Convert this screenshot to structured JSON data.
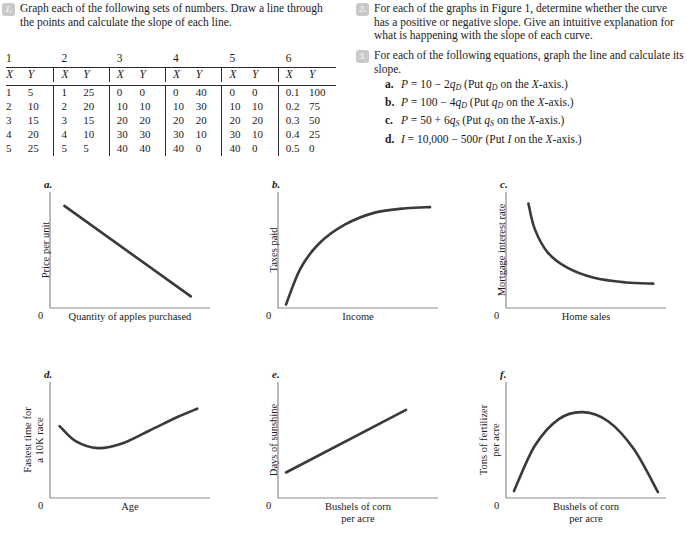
{
  "questions": [
    {
      "number": "1.",
      "text": "Graph each of the following sets of numbers. Draw a line through the points and calculate the slope of each line."
    },
    {
      "number": "2.",
      "text": "For each of the graphs in Figure 1, determine whether the curve has a positive or negative slope. Give an intuitive explanation for what is happening with the slope of each curve."
    },
    {
      "number": "3.",
      "text": "For each of the following equations, graph the line and calculate its slope."
    }
  ],
  "equations": [
    {
      "label": "a.",
      "text": "P = 10 − 2qD (Put qD on the X-axis.)"
    },
    {
      "label": "b.",
      "text": "P = 100 − 4qD (Put qD on the X-axis.)"
    },
    {
      "label": "c.",
      "text": "P = 50 + 6qS (Put qS on the X-axis.)"
    },
    {
      "label": "d.",
      "text": "I = 10,000 − 500r (Put I on the X-axis.)"
    }
  ],
  "table": {
    "group_headers": [
      "1",
      "2",
      "3",
      "4",
      "5",
      "6"
    ],
    "column_headers": [
      "X",
      "Y"
    ],
    "groups": [
      {
        "name": "1",
        "rows": [
          [
            "1",
            "5"
          ],
          [
            "2",
            "10"
          ],
          [
            "3",
            "15"
          ],
          [
            "4",
            "20"
          ],
          [
            "5",
            "25"
          ]
        ]
      },
      {
        "name": "2",
        "rows": [
          [
            "1",
            "25"
          ],
          [
            "2",
            "20"
          ],
          [
            "3",
            "15"
          ],
          [
            "4",
            "10"
          ],
          [
            "5",
            "5"
          ]
        ]
      },
      {
        "name": "3",
        "rows": [
          [
            "0",
            "0"
          ],
          [
            "10",
            "10"
          ],
          [
            "20",
            "20"
          ],
          [
            "30",
            "30"
          ],
          [
            "40",
            "40"
          ]
        ]
      },
      {
        "name": "4",
        "rows": [
          [
            "0",
            "40"
          ],
          [
            "10",
            "30"
          ],
          [
            "20",
            "20"
          ],
          [
            "30",
            "10"
          ],
          [
            "40",
            "0"
          ]
        ]
      },
      {
        "name": "5",
        "rows": [
          [
            "0",
            "0"
          ],
          [
            "10",
            "10"
          ],
          [
            "20",
            "20"
          ],
          [
            "30",
            "10"
          ],
          [
            "40",
            "0"
          ]
        ]
      },
      {
        "name": "6",
        "rows": [
          [
            "0.1",
            "100"
          ],
          [
            "0.2",
            "75"
          ],
          [
            "0.3",
            "50"
          ],
          [
            "0.4",
            "25"
          ],
          [
            "0.5",
            "0"
          ]
        ]
      }
    ]
  },
  "chart_data": [
    {
      "id": "a",
      "panel_label": "a.",
      "type": "line",
      "title": "",
      "ylabel": "Price per unit",
      "xlabel": "Quantity of apples purchased",
      "origin_label": "0",
      "shape": "decreasing-linear",
      "slope_sign": "negative",
      "points": [
        [
          0.09,
          0.88
        ],
        [
          0.88,
          0.1
        ]
      ]
    },
    {
      "id": "b",
      "panel_label": "b.",
      "type": "line",
      "title": "",
      "ylabel": "Taxes paid",
      "xlabel": "Income",
      "origin_label": "0",
      "shape": "concave-increasing",
      "slope_sign": "positive",
      "points": [
        [
          0.05,
          0.03
        ],
        [
          0.14,
          0.34
        ],
        [
          0.26,
          0.56
        ],
        [
          0.42,
          0.72
        ],
        [
          0.6,
          0.82
        ],
        [
          0.8,
          0.86
        ],
        [
          0.95,
          0.87
        ]
      ]
    },
    {
      "id": "c",
      "panel_label": "c.",
      "type": "line",
      "title": "",
      "ylabel": "Mortgage interest rate",
      "xlabel": "Home sales",
      "origin_label": "0",
      "shape": "convex-decreasing",
      "slope_sign": "negative",
      "points": [
        [
          0.14,
          0.9
        ],
        [
          0.18,
          0.68
        ],
        [
          0.26,
          0.48
        ],
        [
          0.38,
          0.35
        ],
        [
          0.55,
          0.26
        ],
        [
          0.75,
          0.22
        ],
        [
          0.92,
          0.21
        ]
      ]
    },
    {
      "id": "d",
      "panel_label": "d.",
      "type": "line",
      "title": "",
      "ylabel": "Fastest time for a 10K race",
      "ylabel_lines": [
        "Fastest time for",
        "a 10K race"
      ],
      "xlabel": "Age",
      "origin_label": "0",
      "shape": "u-shaped",
      "slope_sign": "negative then positive",
      "points": [
        [
          0.06,
          0.62
        ],
        [
          0.16,
          0.49
        ],
        [
          0.3,
          0.43
        ],
        [
          0.45,
          0.47
        ],
        [
          0.62,
          0.58
        ],
        [
          0.8,
          0.7
        ],
        [
          0.92,
          0.77
        ]
      ]
    },
    {
      "id": "e",
      "panel_label": "e.",
      "type": "line",
      "title": "",
      "ylabel": "Days of sunshine",
      "xlabel": "Bushels of corn per acre",
      "xlabel_lines": [
        "Bushels of corn",
        "per acre"
      ],
      "origin_label": "0",
      "shape": "increasing-linear",
      "slope_sign": "positive",
      "points": [
        [
          0.05,
          0.22
        ],
        [
          0.8,
          0.76
        ]
      ]
    },
    {
      "id": "f",
      "panel_label": "f.",
      "type": "line",
      "title": "",
      "ylabel": "Tons of fertilizer per acre",
      "ylabel_lines": [
        "Tons of fertilizer",
        "per acre"
      ],
      "xlabel": "Bushels of corn per acre",
      "xlabel_lines": [
        "Bushels of corn",
        "per acre"
      ],
      "origin_label": "0",
      "shape": "inverted-u",
      "slope_sign": "positive then negative",
      "points": [
        [
          0.05,
          0.06
        ],
        [
          0.18,
          0.45
        ],
        [
          0.33,
          0.68
        ],
        [
          0.48,
          0.74
        ],
        [
          0.64,
          0.66
        ],
        [
          0.8,
          0.42
        ],
        [
          0.95,
          0.05
        ]
      ]
    }
  ]
}
